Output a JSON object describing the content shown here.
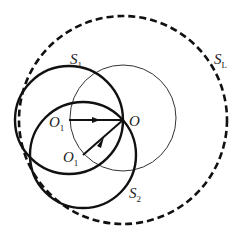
{
  "diagram": {
    "labels": {
      "s1": "S",
      "s1_sub": "1",
      "s2": "S",
      "s2_sub": "2",
      "sl": "S",
      "sl_sub": "L",
      "o": "O",
      "o1_upper": "O",
      "o1_upper_sub": "1",
      "o1_lower": "O",
      "o1_lower_sub": "1"
    },
    "colors": {
      "stroke": "#111111",
      "thin": "#333333"
    },
    "circles": [
      {
        "name": "S_L",
        "cx": 123,
        "cy": 120,
        "r": 104,
        "style": "dashed"
      },
      {
        "name": "thin",
        "cx": 123,
        "cy": 118,
        "r": 53,
        "style": "thin"
      },
      {
        "name": "S_1",
        "cx": 69,
        "cy": 120,
        "r": 54,
        "style": "bold"
      },
      {
        "name": "S_2",
        "cx": 83,
        "cy": 155,
        "r": 53,
        "style": "bold"
      }
    ]
  }
}
